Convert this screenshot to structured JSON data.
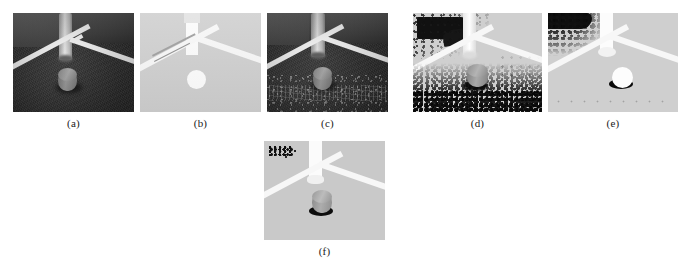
{
  "figure": {
    "type": "multi-panel-image-figure",
    "panel_count": 6,
    "truncated_header_text": "............",
    "panels": [
      {
        "id": "a",
        "caption": "(a)",
        "description": "Original grayscale image: dark carpet ground, white field lines, vertical pole, gray cylindrical puck",
        "rendering": "original-dark",
        "x": 13,
        "y": 13,
        "width": 121,
        "height": 99
      },
      {
        "id": "b",
        "caption": "(b)",
        "description": "Segmented binary result: uniform light-gray background, white lines, white pole, white circular puck",
        "rendering": "segmented-clean",
        "x": 140,
        "y": 13,
        "width": 121,
        "height": 99
      },
      {
        "id": "c",
        "caption": "(c)",
        "description": "Original dark image with residual texture / filtered noise along lower region",
        "rendering": "original-dark-noisy",
        "x": 267,
        "y": 13,
        "width": 121,
        "height": 99
      },
      {
        "id": "d",
        "caption": "(d)",
        "description": "Brightened result with heavy salt-and-pepper noise at bottom and dark blob in upper-left corner",
        "rendering": "bright-heavy-noise",
        "x": 413,
        "y": 13,
        "width": 129,
        "height": 99
      },
      {
        "id": "e",
        "caption": "(e)",
        "description": "Segmented result with dark speckle cluster in upper-left, white puck with dark shadow",
        "rendering": "segmented-corner-noise",
        "x": 548,
        "y": 13,
        "width": 130,
        "height": 99
      },
      {
        "id": "f",
        "caption": "(f)",
        "description": "Final segmented result: clean light background, small residual dark speckle in upper-left corner, gray puck with shadow",
        "rendering": "segmented-final",
        "x": 264,
        "y": 141,
        "width": 121,
        "height": 99
      }
    ],
    "captions_row1_y": 117,
    "captions_row2_y": 245
  },
  "colors": {
    "page_background": "#ffffff",
    "dark_ground": "#2b2b2b",
    "light_ground": "#cfcfcf",
    "field_line_white": "#f7f7f7",
    "puck_gray": "#8d8d8d",
    "pole_light": "#d8d8d8",
    "caption_text": "#1a1a1a",
    "noise_dark": "#151515"
  }
}
